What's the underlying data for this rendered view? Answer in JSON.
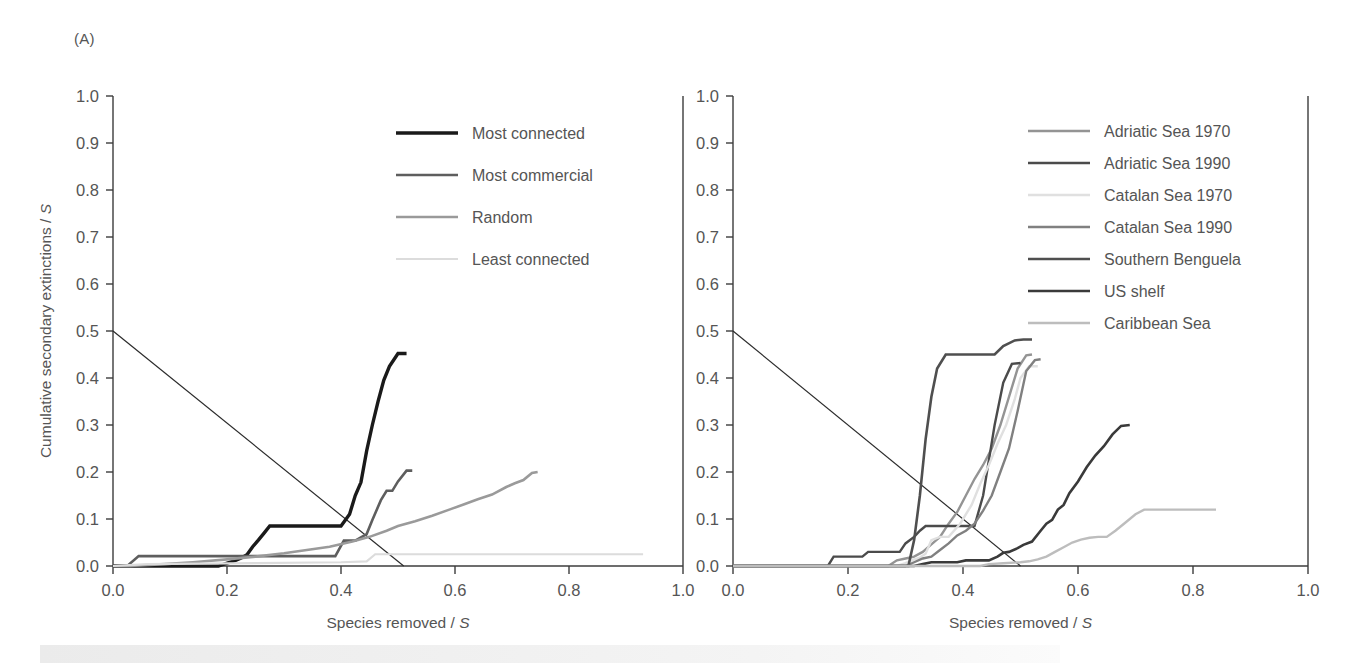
{
  "figure": {
    "panel_a_label": "(A)",
    "panel_b_label": "(B)"
  },
  "chart_data": [
    {
      "type": "line",
      "panel": "(A)",
      "title": "",
      "xlabel": "Species removed / S",
      "ylabel": "Cumulative secondary extinctions / S",
      "xlim": [
        0.0,
        1.0
      ],
      "ylim": [
        0.0,
        1.0
      ],
      "xticks": [
        "0.0",
        "0.2",
        "0.4",
        "0.6",
        "0.8",
        "1.0"
      ],
      "xtickvalues": [
        0.0,
        0.2,
        0.4,
        0.6,
        0.8,
        1.0
      ],
      "yticks": [
        "0.0",
        "0.1",
        "0.2",
        "0.3",
        "0.4",
        "0.5",
        "0.6",
        "0.7",
        "0.8",
        "0.9",
        "1.0"
      ],
      "ytickvalues": [
        0.0,
        0.1,
        0.2,
        0.3,
        0.4,
        0.5,
        0.6,
        0.7,
        0.8,
        0.9,
        1.0
      ],
      "grid": false,
      "legend_position": "upper-center",
      "reference_line": {
        "name": "diagonal",
        "x": [
          0.0,
          0.51
        ],
        "y": [
          0.5,
          0.0
        ]
      },
      "series": [
        {
          "name": "Most connected",
          "color": "#1a1a1a",
          "width": 3.4,
          "x": [
            0.0,
            0.185,
            0.195,
            0.215,
            0.225,
            0.235,
            0.245,
            0.255,
            0.265,
            0.275,
            0.4,
            0.415,
            0.425,
            0.435,
            0.445,
            0.455,
            0.465,
            0.475,
            0.485,
            0.5,
            0.515
          ],
          "y": [
            0.0,
            0.0,
            0.004,
            0.012,
            0.017,
            0.024,
            0.041,
            0.055,
            0.07,
            0.085,
            0.085,
            0.11,
            0.15,
            0.178,
            0.245,
            0.3,
            0.35,
            0.395,
            0.425,
            0.452,
            0.452
          ]
        },
        {
          "name": "Most commercial",
          "color": "#5e5e5e",
          "width": 2.6,
          "x": [
            0.0,
            0.025,
            0.045,
            0.225,
            0.235,
            0.3,
            0.315,
            0.39,
            0.405,
            0.425,
            0.445,
            0.455,
            0.47,
            0.48,
            0.49,
            0.5,
            0.515,
            0.525
          ],
          "y": [
            0.0,
            0.0,
            0.021,
            0.021,
            0.021,
            0.021,
            0.021,
            0.021,
            0.054,
            0.054,
            0.068,
            0.098,
            0.14,
            0.16,
            0.16,
            0.18,
            0.203,
            0.203
          ]
        },
        {
          "name": "Random",
          "color": "#9a9a9a",
          "width": 2.6,
          "x": [
            0.0,
            0.03,
            0.09,
            0.14,
            0.2,
            0.25,
            0.3,
            0.34,
            0.38,
            0.42,
            0.45,
            0.48,
            0.5,
            0.53,
            0.56,
            0.59,
            0.615,
            0.64,
            0.665,
            0.69,
            0.705,
            0.72,
            0.735,
            0.745
          ],
          "y": [
            0.0,
            0.0,
            0.004,
            0.008,
            0.014,
            0.02,
            0.027,
            0.034,
            0.041,
            0.052,
            0.062,
            0.075,
            0.085,
            0.095,
            0.107,
            0.12,
            0.131,
            0.142,
            0.152,
            0.168,
            0.176,
            0.183,
            0.198,
            0.2
          ]
        },
        {
          "name": "Least connected",
          "color": "#dcdcdc",
          "width": 2.2,
          "x": [
            0.0,
            0.03,
            0.06,
            0.25,
            0.4,
            0.445,
            0.46,
            0.55,
            0.7,
            0.85,
            0.93
          ],
          "y": [
            0.0,
            0.002,
            0.004,
            0.006,
            0.008,
            0.01,
            0.025,
            0.025,
            0.025,
            0.025,
            0.025
          ]
        }
      ]
    },
    {
      "type": "line",
      "panel": "(B)",
      "title": "",
      "xlabel": "Species removed / S",
      "ylabel": "",
      "xlim": [
        0.0,
        1.0
      ],
      "ylim": [
        0.0,
        1.0
      ],
      "xticks": [
        "0.0",
        "0.2",
        "0.4",
        "0.6",
        "0.8",
        "1.0"
      ],
      "xtickvalues": [
        0.0,
        0.2,
        0.4,
        0.6,
        0.8,
        1.0
      ],
      "yticks": [
        "0.0",
        "0.1",
        "0.2",
        "0.3",
        "0.4",
        "0.5",
        "0.6",
        "0.7",
        "0.8",
        "0.9",
        "1.0"
      ],
      "ytickvalues": [
        0.0,
        0.1,
        0.2,
        0.3,
        0.4,
        0.5,
        0.6,
        0.7,
        0.8,
        0.9,
        1.0
      ],
      "grid": false,
      "legend_position": "upper-right",
      "reference_line": {
        "name": "diagonal",
        "x": [
          0.0,
          0.5
        ],
        "y": [
          0.5,
          0.0
        ]
      },
      "series": [
        {
          "name": "Adriatic Sea 1970",
          "color": "#949494",
          "width": 2.4,
          "x": [
            0.0,
            0.27,
            0.285,
            0.3,
            0.315,
            0.33,
            0.345,
            0.36,
            0.375,
            0.39,
            0.405,
            0.42,
            0.435,
            0.45,
            0.465,
            0.48,
            0.495,
            0.51,
            0.52
          ],
          "y": [
            0.0,
            0.0,
            0.012,
            0.016,
            0.02,
            0.03,
            0.046,
            0.062,
            0.09,
            0.115,
            0.15,
            0.185,
            0.215,
            0.25,
            0.3,
            0.36,
            0.42,
            0.448,
            0.45
          ]
        },
        {
          "name": "Adriatic Sea 1990",
          "color": "#4b4b4b",
          "width": 2.4,
          "x": [
            0.0,
            0.165,
            0.175,
            0.225,
            0.235,
            0.29,
            0.3,
            0.315,
            0.325,
            0.335,
            0.345,
            0.36,
            0.42,
            0.435,
            0.455,
            0.47,
            0.485,
            0.5
          ],
          "y": [
            0.0,
            0.0,
            0.02,
            0.02,
            0.03,
            0.03,
            0.048,
            0.062,
            0.075,
            0.085,
            0.085,
            0.085,
            0.085,
            0.15,
            0.3,
            0.39,
            0.43,
            0.432
          ]
        },
        {
          "name": "Catalan Sea 1970",
          "color": "#e0e0e0",
          "width": 2.4,
          "x": [
            0.0,
            0.285,
            0.3,
            0.315,
            0.325,
            0.335,
            0.345,
            0.36,
            0.375,
            0.395,
            0.415,
            0.43,
            0.445,
            0.46,
            0.475,
            0.49,
            0.5,
            0.515,
            0.53
          ],
          "y": [
            0.0,
            0.0,
            0.006,
            0.014,
            0.018,
            0.026,
            0.055,
            0.062,
            0.062,
            0.09,
            0.13,
            0.175,
            0.215,
            0.26,
            0.3,
            0.355,
            0.4,
            0.425,
            0.425
          ]
        },
        {
          "name": "Catalan Sea 1990",
          "color": "#808080",
          "width": 2.4,
          "x": [
            0.0,
            0.3,
            0.315,
            0.33,
            0.345,
            0.36,
            0.375,
            0.39,
            0.405,
            0.42,
            0.435,
            0.45,
            0.465,
            0.48,
            0.495,
            0.51,
            0.525,
            0.535
          ],
          "y": [
            0.0,
            0.0,
            0.008,
            0.016,
            0.02,
            0.034,
            0.048,
            0.065,
            0.075,
            0.09,
            0.118,
            0.15,
            0.2,
            0.25,
            0.33,
            0.415,
            0.438,
            0.44
          ]
        },
        {
          "name": "Southern Benguela",
          "color": "#4f4f4f",
          "width": 2.6,
          "x": [
            0.0,
            0.305,
            0.315,
            0.325,
            0.335,
            0.345,
            0.355,
            0.37,
            0.42,
            0.455,
            0.47,
            0.49,
            0.505,
            0.52
          ],
          "y": [
            0.0,
            0.0,
            0.055,
            0.15,
            0.27,
            0.36,
            0.42,
            0.45,
            0.45,
            0.45,
            0.468,
            0.48,
            0.482,
            0.482
          ]
        },
        {
          "name": "US shelf",
          "color": "#3a3a3a",
          "width": 2.6,
          "x": [
            0.0,
            0.315,
            0.33,
            0.345,
            0.39,
            0.405,
            0.445,
            0.46,
            0.47,
            0.48,
            0.495,
            0.505,
            0.52,
            0.535,
            0.545,
            0.555,
            0.565,
            0.575,
            0.585,
            0.6,
            0.615,
            0.63,
            0.645,
            0.66,
            0.675,
            0.69
          ],
          "y": [
            0.0,
            0.0,
            0.004,
            0.008,
            0.008,
            0.012,
            0.012,
            0.02,
            0.028,
            0.03,
            0.038,
            0.045,
            0.052,
            0.075,
            0.09,
            0.098,
            0.12,
            0.13,
            0.155,
            0.18,
            0.21,
            0.235,
            0.255,
            0.28,
            0.298,
            0.3
          ]
        },
        {
          "name": "Caribbean Sea",
          "color": "#bdbdbd",
          "width": 2.4,
          "x": [
            0.0,
            0.43,
            0.445,
            0.47,
            0.5,
            0.515,
            0.53,
            0.545,
            0.56,
            0.575,
            0.59,
            0.605,
            0.62,
            0.635,
            0.65,
            0.665,
            0.68,
            0.7,
            0.715,
            0.78,
            0.84
          ],
          "y": [
            0.0,
            0.0,
            0.004,
            0.006,
            0.008,
            0.01,
            0.014,
            0.02,
            0.03,
            0.04,
            0.05,
            0.056,
            0.06,
            0.062,
            0.062,
            0.075,
            0.09,
            0.11,
            0.12,
            0.12,
            0.12
          ]
        }
      ]
    }
  ]
}
